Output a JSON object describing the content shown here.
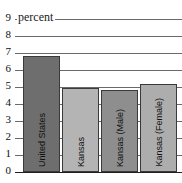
{
  "chart_data": {
    "type": "bar",
    "title": "",
    "subtitle": "",
    "xlabel": "",
    "ylabel": "percent",
    "ylim": [
      0,
      9
    ],
    "ytick_step": 1,
    "yticks": [
      "0",
      "1",
      "2",
      "3",
      "4",
      "5",
      "6",
      "7",
      "8",
      "9"
    ],
    "grid": true,
    "legend": "none",
    "categories": [
      "United States",
      "Kansas",
      "Kansas (Male)",
      "Kansas (Female)"
    ],
    "values": [
      6.8,
      4.95,
      4.8,
      5.2
    ],
    "bar_colors": [
      "#6e6e6e",
      "#b4b4b4",
      "#8e8e8e",
      "#adadad"
    ],
    "bar_border_color": "#3a3a3a",
    "axis_color": "#1f1f1f",
    "gridline_color": "#6a6a6a",
    "text_color": "#111111"
  },
  "axis": {
    "caption": "percent"
  }
}
